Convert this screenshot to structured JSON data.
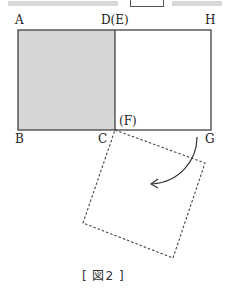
{
  "figure": {
    "caption": "[ 図2 ]",
    "labels": {
      "A": "A",
      "D_E": "D(E)",
      "H": "H",
      "B": "B",
      "C": "C",
      "F": "(F)",
      "G": "G"
    },
    "colors": {
      "shaded_fill": "#d6d6d6",
      "stroke": "#333333",
      "dashed_stroke": "#444444"
    },
    "shapes": {
      "rectangle_ABGH": "solid outline",
      "square_ABCD": "shaded",
      "square_EFGH_rotated": "dashed outline, rotated about C(F)",
      "arrow": "curved rotation arrow"
    }
  }
}
